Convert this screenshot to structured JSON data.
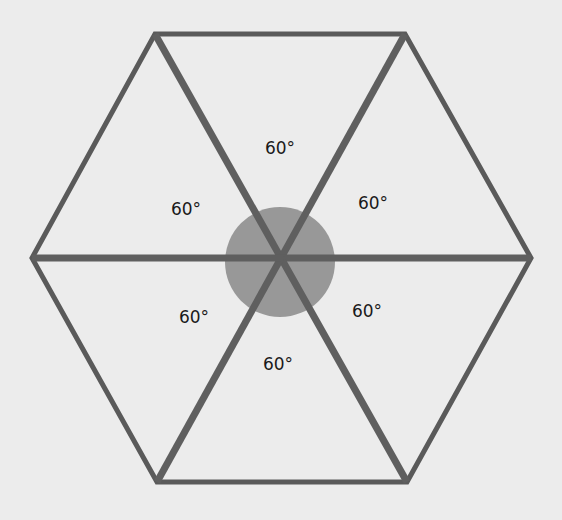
{
  "diagram": {
    "title": "",
    "shape": "regular-hexagon",
    "background_color": "#ececec",
    "stroke_color": "#5a5a5a",
    "center_circle_color": "#8f8f8f",
    "center": {
      "x": 281,
      "y": 258
    },
    "center_circle": {
      "cx": 280,
      "cy": 262,
      "r": 55
    },
    "vertices": [
      {
        "name": "top-left",
        "x": 155,
        "y": 34
      },
      {
        "name": "top-right",
        "x": 405,
        "y": 34
      },
      {
        "name": "right",
        "x": 531,
        "y": 258
      },
      {
        "name": "bottom-right",
        "x": 407,
        "y": 482
      },
      {
        "name": "bottom-left",
        "x": 157,
        "y": 482
      },
      {
        "name": "left",
        "x": 32,
        "y": 258
      }
    ],
    "angle_labels": [
      {
        "position": "top",
        "text": "60°",
        "x": 280,
        "y": 148
      },
      {
        "position": "upper-right",
        "text": "60°",
        "x": 373,
        "y": 203
      },
      {
        "position": "lower-right",
        "text": "60°",
        "x": 367,
        "y": 311
      },
      {
        "position": "bottom",
        "text": "60°",
        "x": 278,
        "y": 364
      },
      {
        "position": "lower-left",
        "text": "60°",
        "x": 194,
        "y": 317
      },
      {
        "position": "upper-left",
        "text": "60°",
        "x": 186,
        "y": 209
      }
    ]
  }
}
